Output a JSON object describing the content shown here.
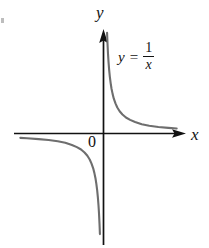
{
  "figure": {
    "background_color": "#ffffff",
    "axis_color": "#111111",
    "curve_color": "#6e6e6e",
    "origin_label": "0",
    "x_axis_label": "x",
    "y_axis_label": "y",
    "equation": {
      "lhs": "y",
      "operator": "=",
      "numerator": "1",
      "denominator": "x",
      "plain": "y = 1/x"
    }
  },
  "chart_data": {
    "type": "line",
    "title": "",
    "subtitle": "",
    "xlabel": "x",
    "ylabel": "y",
    "function": "y = 1/x",
    "grid": false,
    "legend": null,
    "annotations": [
      {
        "text": "y = 1/x",
        "x": 1.9,
        "y": 3.1
      },
      {
        "text": "0",
        "x": -0.28,
        "y": -0.38
      }
    ],
    "axes": {
      "x_axis_arrow": true,
      "y_axis_arrow": true,
      "xlim": [
        -5.1,
        4.6
      ],
      "ylim": [
        -5.3,
        4.6
      ],
      "x_ticks": [],
      "y_ticks": [],
      "x_tick_labels": [],
      "y_tick_labels": [],
      "origin": {
        "x": 0,
        "y": 0
      }
    },
    "series": [
      {
        "name": "branch-quadrant-I",
        "x": [
          0.215,
          0.24,
          0.27,
          0.3,
          0.34,
          0.38,
          0.43,
          0.48,
          0.55,
          0.62,
          0.72,
          0.83,
          0.97,
          1.14,
          1.35,
          1.6,
          1.9,
          2.3,
          2.75,
          3.3,
          3.9,
          4.4
        ],
        "y": [
          4.65,
          4.17,
          3.7,
          3.33,
          2.94,
          2.63,
          2.33,
          2.08,
          1.82,
          1.61,
          1.39,
          1.2,
          1.03,
          0.88,
          0.74,
          0.63,
          0.53,
          0.43,
          0.36,
          0.3,
          0.26,
          0.23
        ]
      },
      {
        "name": "branch-quadrant-III",
        "x": [
          -0.215,
          -0.24,
          -0.27,
          -0.3,
          -0.34,
          -0.38,
          -0.43,
          -0.48,
          -0.55,
          -0.62,
          -0.72,
          -0.83,
          -0.97,
          -1.14,
          -1.35,
          -1.6,
          -1.9,
          -2.3,
          -2.75,
          -3.3,
          -3.9,
          -4.6,
          -5.0
        ],
        "y": [
          -4.65,
          -4.17,
          -3.7,
          -3.33,
          -2.94,
          -2.63,
          -2.33,
          -2.08,
          -1.82,
          -1.61,
          -1.39,
          -1.2,
          -1.03,
          -0.88,
          -0.74,
          -0.63,
          -0.53,
          -0.43,
          -0.36,
          -0.3,
          -0.26,
          -0.22,
          -0.2
        ]
      }
    ]
  }
}
